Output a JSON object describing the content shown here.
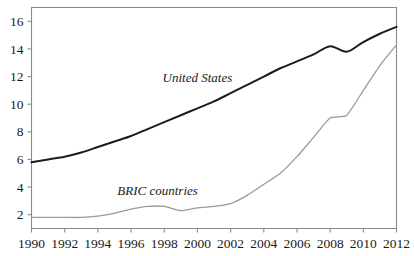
{
  "chart_data": {
    "type": "line",
    "title": "",
    "subtitle": "",
    "xlabel": "",
    "ylabel": "",
    "xlim": [
      1990,
      2012
    ],
    "ylim": [
      1,
      17
    ],
    "grid": false,
    "legend_position": "inline-annotation",
    "x_ticks": [
      1990,
      1992,
      1994,
      1996,
      1998,
      2000,
      2002,
      2004,
      2006,
      2008,
      2010,
      2012
    ],
    "y_ticks": [
      2,
      4,
      6,
      8,
      10,
      12,
      14,
      16
    ],
    "x": [
      1990,
      1991,
      1992,
      1993,
      1994,
      1995,
      1996,
      1997,
      1998,
      1999,
      2000,
      2001,
      2002,
      2003,
      2004,
      2005,
      2006,
      2007,
      2008,
      2009,
      2010,
      2011,
      2012
    ],
    "series": [
      {
        "name": "United States",
        "color": "#1c1c1c",
        "values": [
          5.8,
          6.0,
          6.2,
          6.5,
          6.9,
          7.3,
          7.7,
          8.2,
          8.7,
          9.2,
          9.7,
          10.2,
          10.8,
          11.4,
          12.0,
          12.6,
          13.1,
          13.6,
          14.2,
          13.8,
          14.5,
          15.1,
          15.6
        ],
        "label_x": 2000,
        "label_y": 11.6
      },
      {
        "name": "BRIC countries",
        "color": "#9a9a9a",
        "values": [
          1.8,
          1.8,
          1.8,
          1.8,
          1.9,
          2.1,
          2.4,
          2.6,
          2.6,
          2.3,
          2.5,
          2.6,
          2.8,
          3.4,
          4.2,
          5.0,
          6.2,
          7.6,
          9.0,
          9.2,
          11.0,
          12.8,
          14.3
        ],
        "label_x": 1997.6,
        "label_y": 3.45
      }
    ]
  },
  "annotations": {
    "united_states_label": "United States",
    "bric_label": "BRIC countries"
  },
  "colors": {
    "axis": "#8a8a8a",
    "united_states": "#1c1c1c",
    "bric": "#9a9a9a",
    "background": "#ffffff",
    "text": "#1a1a1a"
  }
}
